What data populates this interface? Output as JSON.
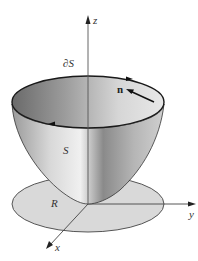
{
  "figure": {
    "labels": {
      "z_axis": "z",
      "y_axis": "y",
      "x_axis": "x",
      "boundary": "∂S",
      "normal": "n",
      "surface": "S",
      "region": "R"
    },
    "colors": {
      "region_fill": "#d9d9d9",
      "region_stroke": "#555555",
      "surface_dark": "#6f6f6f",
      "surface_light": "#e6e6e6",
      "rim_stroke": "#1a1a1a",
      "axis_stroke": "#444444"
    }
  }
}
